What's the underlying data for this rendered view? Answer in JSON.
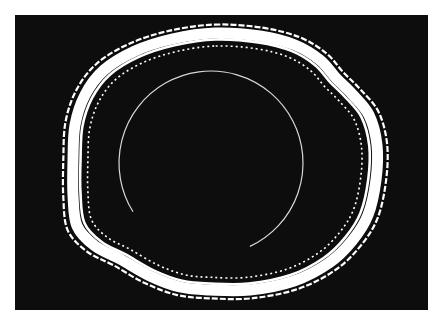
{
  "image": {
    "width": 442,
    "height": 326,
    "page_background": "#ffffff",
    "panel": {
      "x": 15,
      "y": 15,
      "width": 413,
      "height": 295,
      "color": "#0d0d0d"
    },
    "foreground_color": "#ffffff"
  },
  "rings": {
    "center": [
      222,
      163
    ],
    "centerline": [
      [
        215,
        33
      ],
      [
        260,
        36
      ],
      [
        295,
        45
      ],
      [
        320,
        60
      ],
      [
        336,
        78
      ],
      [
        352,
        94
      ],
      [
        369,
        115
      ],
      [
        377,
        145
      ],
      [
        376,
        180
      ],
      [
        368,
        215
      ],
      [
        352,
        241
      ],
      [
        329,
        263
      ],
      [
        294,
        281
      ],
      [
        250,
        290
      ],
      [
        210,
        290
      ],
      [
        180,
        287
      ],
      [
        150,
        276
      ],
      [
        120,
        259
      ],
      [
        95,
        246
      ],
      [
        77,
        226
      ],
      [
        73,
        195
      ],
      [
        73,
        160
      ],
      [
        75,
        125
      ],
      [
        85,
        95
      ],
      [
        104,
        70
      ],
      [
        135,
        51
      ],
      [
        172,
        39
      ]
    ],
    "layers": [
      {
        "name": "outer-thin-line",
        "scale": 1.065,
        "stroke_width": 2.2,
        "dash": "6 2"
      },
      {
        "name": "main-band",
        "scale": 1.0,
        "stroke_width": 11,
        "dash": ""
      },
      {
        "name": "inner-thin-ring",
        "scale": 0.95,
        "stroke_width": 2.6,
        "dash": ""
      },
      {
        "name": "inner-dotted-ring",
        "scale": 0.9,
        "stroke_width": 1.6,
        "dash": "2 3"
      }
    ]
  },
  "arc": {
    "center": [
      211,
      163
    ],
    "radius": 92,
    "start_deg": 148,
    "end_deg": 425,
    "stroke_width": 1.2,
    "color": "#d8d8d8"
  }
}
